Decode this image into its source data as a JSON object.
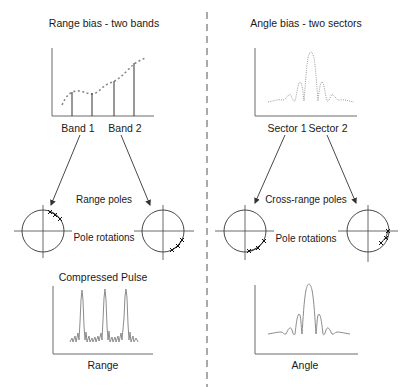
{
  "left_panel": {
    "title": "Range bias - two bands",
    "band_labels": [
      "Band 1",
      "Band 2"
    ],
    "poles_label": "Range poles",
    "rotations_label": "Pole rotations",
    "pulse_title": "Compressed Pulse",
    "x_axis_label": "Range"
  },
  "right_panel": {
    "title": "Angle bias - two sectors",
    "sector_labels": [
      "Sector 1",
      "Sector 2"
    ],
    "poles_label": "Cross-range poles",
    "rotations_label": "Pole rotations",
    "x_axis_label": "Angle"
  },
  "icons": {
    "pole_marker": "x-mark"
  },
  "colors": {
    "line": "#333333",
    "curve": "#8c8c8c",
    "background": "#ffffff"
  }
}
